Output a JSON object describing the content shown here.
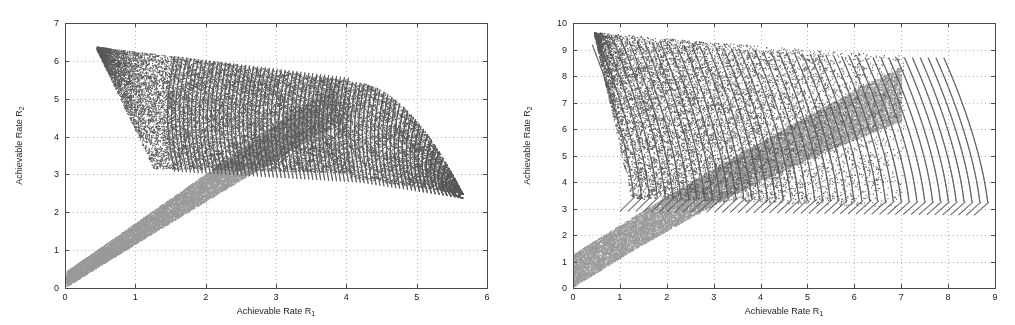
{
  "figure": {
    "background": "#ffffff",
    "axis_color": "#4a4a4a",
    "grid_color": "#b9b9b9",
    "text_color": "#1b1b1b",
    "dark_series_color": "#585858",
    "light_series_color": "#9a9a9a"
  },
  "chart_data": [
    {
      "id": "left-plot",
      "type": "scatter",
      "title": "",
      "subtitle": "",
      "xlabel": "Achievable Rate R",
      "xlabel_sub": "1",
      "ylabel": "Achievable Rate R",
      "ylabel_sub": "2",
      "xlim": [
        0,
        6
      ],
      "ylim": [
        0,
        7
      ],
      "xticks": [
        0,
        1,
        2,
        3,
        4,
        5,
        6
      ],
      "yticks": [
        0,
        1,
        2,
        3,
        4,
        5,
        6,
        7
      ],
      "xtick_labels": [
        "0",
        "1",
        "2",
        "3",
        "4",
        "5",
        "6"
      ],
      "ytick_labels": [
        "0",
        "1",
        "2",
        "3",
        "4",
        "5",
        "6",
        "7"
      ],
      "grid": true,
      "legend": "none",
      "series": [
        {
          "name": "dark-region",
          "color": "#585858",
          "marker": "dot",
          "description": "Dense dark point cloud: wedge apex near (0.45,6.35), upper boundary sweeping right and down to (4.05,5.45), fan of vertical strands descending to a lower envelope from (1.25,3.15) through (3.3,3.0) out to the tip at (5.65,2.5).",
          "outline": [
            [
              0.45,
              6.35
            ],
            [
              1.1,
              6.1
            ],
            [
              1.9,
              5.95
            ],
            [
              2.7,
              5.75
            ],
            [
              3.4,
              5.6
            ],
            [
              4.05,
              5.45
            ],
            [
              4.6,
              4.95
            ],
            [
              5.1,
              4.15
            ],
            [
              5.45,
              3.3
            ],
            [
              5.65,
              2.5
            ],
            [
              5.1,
              2.75
            ],
            [
              4.3,
              2.9
            ],
            [
              3.4,
              3.0
            ],
            [
              2.4,
              3.05
            ],
            [
              1.6,
              3.1
            ],
            [
              1.25,
              3.15
            ],
            [
              1.0,
              4.2
            ],
            [
              0.72,
              5.3
            ],
            [
              0.45,
              6.35
            ]
          ],
          "n_points": 22000
        },
        {
          "name": "light-region",
          "color": "#9a9a9a",
          "marker": "dot",
          "description": "Lighter grey band rising from the origin corner (0,0.38) diagonally to the crest near (3.85,5.45), bounded below by a line from (0.2,0.3) up through (2.6,3.1) to (3.9,4.6).",
          "outline": [
            [
              0.0,
              0.38
            ],
            [
              0.45,
              1.0
            ],
            [
              0.95,
              1.75
            ],
            [
              1.35,
              2.25
            ],
            [
              1.85,
              2.9
            ],
            [
              2.4,
              3.65
            ],
            [
              3.0,
              4.45
            ],
            [
              3.5,
              5.05
            ],
            [
              3.85,
              5.45
            ],
            [
              3.95,
              5.1
            ],
            [
              3.7,
              4.5
            ],
            [
              3.1,
              3.8
            ],
            [
              2.5,
              3.1
            ],
            [
              1.9,
              2.4
            ],
            [
              1.3,
              1.7
            ],
            [
              0.75,
              1.0
            ],
            [
              0.3,
              0.42
            ],
            [
              0.2,
              0.3
            ],
            [
              0.0,
              0.38
            ]
          ],
          "n_points": 16000
        }
      ]
    },
    {
      "id": "right-plot",
      "type": "scatter",
      "title": "",
      "subtitle": "",
      "xlabel": "Achievable Rate R",
      "xlabel_sub": "1",
      "ylabel": "Achievable Rate R",
      "ylabel_sub": "2",
      "xlim": [
        0,
        9
      ],
      "ylim": [
        0,
        10
      ],
      "xticks": [
        0,
        1,
        2,
        3,
        4,
        5,
        6,
        7,
        8,
        9
      ],
      "yticks": [
        0,
        1,
        2,
        3,
        4,
        5,
        6,
        7,
        8,
        9,
        10
      ],
      "xtick_labels": [
        "0",
        "1",
        "2",
        "3",
        "4",
        "5",
        "6",
        "7",
        "8",
        "9"
      ],
      "ytick_labels": [
        "0",
        "1",
        "2",
        "3",
        "4",
        "5",
        "6",
        "7",
        "8",
        "9",
        "10"
      ],
      "grid": true,
      "legend": "none",
      "series": [
        {
          "name": "dark-region",
          "color": "#585858",
          "marker": "dot",
          "description": "Dark cloud with apex near (0.45,9.65), upper envelope falling gently to (7.05,8.75), then a bundle of ~45 arc strands curving down to a flat floor near y=2.75 extending to (8.85,2.75); left lower corner cut at (1.25,3.35).",
          "outline": [
            [
              0.45,
              9.65
            ],
            [
              1.5,
              9.35
            ],
            [
              2.6,
              9.15
            ],
            [
              3.8,
              9.0
            ],
            [
              5.0,
              8.9
            ],
            [
              6.1,
              8.82
            ],
            [
              7.05,
              8.75
            ],
            [
              7.6,
              8.2
            ],
            [
              8.1,
              6.6
            ],
            [
              8.5,
              4.6
            ],
            [
              8.85,
              2.75
            ],
            [
              8.0,
              2.72
            ],
            [
              6.8,
              2.75
            ],
            [
              5.4,
              2.85
            ],
            [
              4.2,
              2.95
            ],
            [
              3.2,
              3.05
            ],
            [
              2.2,
              3.2
            ],
            [
              1.25,
              3.35
            ],
            [
              0.95,
              5.4
            ],
            [
              0.7,
              7.5
            ],
            [
              0.45,
              9.65
            ]
          ],
          "n_points": 26000
        },
        {
          "name": "light-region",
          "color": "#9a9a9a",
          "marker": "dot",
          "description": "Lighter grey wedge starting at the origin (0,0.05)-(0,1.25) and widening upward to the right, crest reaching about (7.0,8.75) along the diagonal; lower edge passes (3.0,3.4) and (5.0,5.6).",
          "outline": [
            [
              0.0,
              1.25
            ],
            [
              1.0,
              2.5
            ],
            [
              2.0,
              3.75
            ],
            [
              3.0,
              4.95
            ],
            [
              4.2,
              6.3
            ],
            [
              5.4,
              7.5
            ],
            [
              6.3,
              8.25
            ],
            [
              7.0,
              8.75
            ],
            [
              7.0,
              8.35
            ],
            [
              6.2,
              7.6
            ],
            [
              5.0,
              6.3
            ],
            [
              3.9,
              5.05
            ],
            [
              2.8,
              3.8
            ],
            [
              1.7,
              2.5
            ],
            [
              0.8,
              1.25
            ],
            [
              0.0,
              0.05
            ],
            [
              0.0,
              1.25
            ]
          ],
          "n_points": 18000
        }
      ]
    }
  ]
}
